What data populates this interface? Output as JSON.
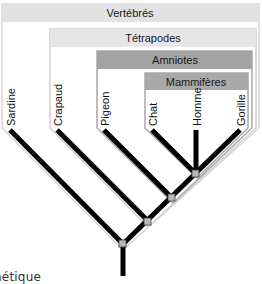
{
  "diagram": {
    "type": "cladogram",
    "clades": [
      {
        "id": "vertebres",
        "label": "Vertébrés",
        "header_color": "#e2e2e2",
        "members": [
          "Sardine",
          "Crapaud",
          "Pigeon",
          "Chat",
          "Homme",
          "Gorille"
        ]
      },
      {
        "id": "tetrapodes",
        "label": "Tétrapodes",
        "header_color": "#e6e6e6",
        "members": [
          "Crapaud",
          "Pigeon",
          "Chat",
          "Homme",
          "Gorille"
        ]
      },
      {
        "id": "amniotes",
        "label": "Amniotes",
        "header_color": "#a3a3a3",
        "members": [
          "Pigeon",
          "Chat",
          "Homme",
          "Gorille"
        ]
      },
      {
        "id": "mammiferes",
        "label": "Mammifères",
        "header_color": "#a9a9a9",
        "members": [
          "Chat",
          "Homme",
          "Gorille"
        ]
      }
    ],
    "leaves": [
      "Sardine",
      "Crapaud",
      "Pigeon",
      "Chat",
      "Homme",
      "Gorille"
    ],
    "branch_color": "#000000",
    "node_color": "#b8b8b8",
    "caption_partial": "nétique"
  }
}
